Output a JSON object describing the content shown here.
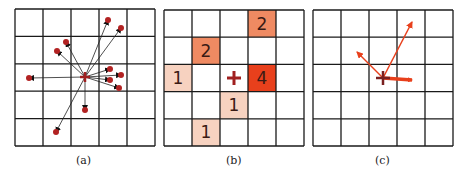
{
  "figure": {
    "panels": [
      {
        "id": "a",
        "caption": "(a)",
        "grid": {
          "x": 15,
          "y": 9,
          "w": 140,
          "h": 137,
          "rows": 5,
          "cols": 5
        },
        "center": {
          "x": 85,
          "y": 77
        },
        "points": [
          {
            "x": 108,
            "y": 20
          },
          {
            "x": 121,
            "y": 28
          },
          {
            "x": 66,
            "y": 42
          },
          {
            "x": 57,
            "y": 51
          },
          {
            "x": 29,
            "y": 78
          },
          {
            "x": 110,
            "y": 69
          },
          {
            "x": 121,
            "y": 75
          },
          {
            "x": 110,
            "y": 80
          },
          {
            "x": 119,
            "y": 88
          },
          {
            "x": 85,
            "y": 110
          },
          {
            "x": 56,
            "y": 132
          }
        ]
      },
      {
        "id": "b",
        "caption": "(b)",
        "grid": {
          "x": 164,
          "y": 10,
          "w": 140,
          "h": 136,
          "rows": 5,
          "cols": 5
        },
        "center_cell": {
          "row": 2,
          "col": 2
        },
        "cells": [
          {
            "row": 0,
            "col": 3,
            "value": "2",
            "color": "#ef8a62"
          },
          {
            "row": 1,
            "col": 1,
            "value": "2",
            "color": "#ef8a62"
          },
          {
            "row": 2,
            "col": 0,
            "value": "1",
            "color": "#f7d2c0"
          },
          {
            "row": 2,
            "col": 3,
            "value": "4",
            "color": "#e8401c"
          },
          {
            "row": 3,
            "col": 2,
            "value": "1",
            "color": "#f7d2c0"
          },
          {
            "row": 4,
            "col": 1,
            "value": "1",
            "color": "#f7d2c0"
          }
        ]
      },
      {
        "id": "c",
        "caption": "(c)",
        "grid": {
          "x": 313,
          "y": 10,
          "w": 140,
          "h": 136,
          "rows": 5,
          "cols": 5
        },
        "center": {
          "x": 383,
          "y": 78
        },
        "vectors": [
          {
            "x2": 357,
            "y2": 52,
            "width": 1.5
          },
          {
            "x2": 412,
            "y2": 22,
            "width": 1.5
          },
          {
            "x2": 412,
            "y2": 80,
            "width": 3.5
          }
        ]
      }
    ],
    "colors": {
      "grid_line": "#1a1a1a",
      "point": "#b22222",
      "arrow": "#e8401c",
      "cross": "#a02020"
    }
  }
}
